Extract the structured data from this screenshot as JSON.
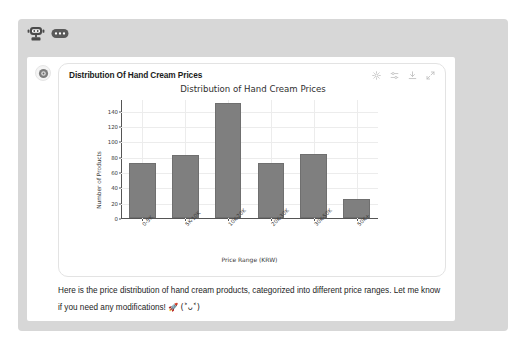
{
  "assistant": {
    "avatar_icon": "robot-icon",
    "typing_bubble_icon": "dots-bubble-icon"
  },
  "card": {
    "avatar_icon": "assistant-logo-icon"
  },
  "widget": {
    "title": "Distribution Of Hand Cream Prices",
    "actions": [
      {
        "name": "settings-icon",
        "label": "Settings"
      },
      {
        "name": "sliders-icon",
        "label": "Adjust"
      },
      {
        "name": "download-icon",
        "label": "Download"
      },
      {
        "name": "expand-icon",
        "label": "Expand"
      }
    ]
  },
  "chart_data": {
    "type": "bar",
    "title": "Distribution of Hand Cream Prices",
    "xlabel": "Price Range (KRW)",
    "ylabel": "Number of Products",
    "categories": [
      "0-5K",
      "5K-10K",
      "10K-20K",
      "20K-30K",
      "30K-50K",
      "50K+"
    ],
    "values": [
      72,
      82,
      150,
      72,
      84,
      25
    ],
    "yticks": [
      0,
      20,
      40,
      60,
      80,
      100,
      120,
      140
    ],
    "ylim": [
      0,
      155
    ],
    "grid": true,
    "legend": null,
    "bar_color": "#7f7f7f",
    "xtick_rotation": -45
  },
  "message": {
    "line1": "Here is the price distribution of hand cream products, categorized into different price ranges. Let",
    "line2": "me know if you need any modifications!",
    "emoji": "🚀",
    "kaomoji": "(˃ᴗ˂)"
  },
  "colors": {
    "panel_bg": "#d7d7d7",
    "card_bg": "#ffffff",
    "bar": "#7f7f7f",
    "grid": "#ececec",
    "text": "#1d1d1d"
  }
}
